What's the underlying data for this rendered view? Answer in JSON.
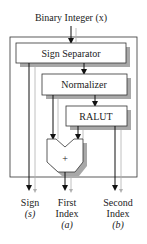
{
  "diagram": {
    "input_label": "Binary Integer (x)",
    "blocks": [
      {
        "id": "sign-separator",
        "label": "Sign Separator"
      },
      {
        "id": "normalizer",
        "label": "Normalizer"
      },
      {
        "id": "ralut",
        "label": "RALUT"
      },
      {
        "id": "adder",
        "label": "+"
      }
    ],
    "outputs": [
      {
        "line1": "Sign",
        "line2": "(s)",
        "line3": ""
      },
      {
        "line1": "First",
        "line2": "Index",
        "line3": "(a)"
      },
      {
        "line1": "Second",
        "line2": "Index",
        "line3": "(b)"
      }
    ],
    "colors": {
      "line": "#222222",
      "shadow": "#a8a8a8",
      "box_fill": "#ffffff",
      "gray_line": "#b0b0b0"
    }
  }
}
